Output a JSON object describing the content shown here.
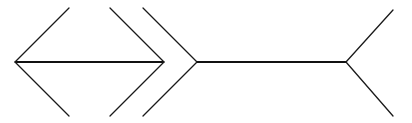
{
  "figure": {
    "colors": {
      "line": "#1a1a1a",
      "background": "#ffffff"
    },
    "left_figure": {
      "shaft": {
        "x1": 15,
        "y1": 62,
        "x2": 164,
        "y2": 62
      },
      "left_head": [
        {
          "x1": 15,
          "y1": 62,
          "x2": 69,
          "y2": 8
        },
        {
          "x1": 15,
          "y1": 62,
          "x2": 69,
          "y2": 116
        }
      ],
      "right_head": [
        {
          "x1": 164,
          "y1": 62,
          "x2": 110,
          "y2": 8
        },
        {
          "x1": 164,
          "y1": 62,
          "x2": 110,
          "y2": 116
        }
      ]
    },
    "right_figure": {
      "shaft": {
        "x1": 197,
        "y1": 62,
        "x2": 346,
        "y2": 62
      },
      "left_tail": [
        {
          "x1": 197,
          "y1": 62,
          "x2": 143,
          "y2": 8
        },
        {
          "x1": 197,
          "y1": 62,
          "x2": 143,
          "y2": 116
        }
      ],
      "right_tail": [
        {
          "x1": 346,
          "y1": 62,
          "x2": 393,
          "y2": 10
        },
        {
          "x1": 346,
          "y1": 62,
          "x2": 393,
          "y2": 116
        }
      ]
    }
  }
}
